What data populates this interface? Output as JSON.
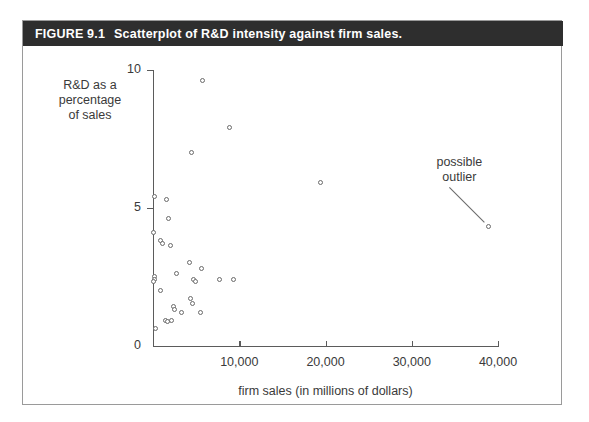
{
  "figure": {
    "number": "FIGURE 9.1",
    "caption": "Scatterplot of R&D intensity against firm sales."
  },
  "annotation": {
    "label": "possible\noutlier"
  },
  "chart_data": {
    "type": "scatter",
    "title": "Scatterplot of R&D intensity against firm sales.",
    "xlabel": "firm sales (in millions of dollars)",
    "ylabel": "R&D as a\npercentage\nof sales",
    "xlim": [
      0,
      40000
    ],
    "ylim": [
      0,
      10
    ],
    "xticks": [
      0,
      10000,
      20000,
      30000,
      40000
    ],
    "xticklabels": [
      "",
      "10,000",
      "20,000",
      "30,000",
      "40,000"
    ],
    "yticks": [
      0,
      5,
      10
    ],
    "yticklabels": [
      "0",
      "5",
      "10"
    ],
    "grid": false,
    "legend": null,
    "annotations": [
      {
        "text": "possible outlier",
        "points_to_x": 39000,
        "points_to_y": 4.3
      }
    ],
    "points": [
      {
        "x": 5800,
        "y": 9.6
      },
      {
        "x": 9000,
        "y": 7.9
      },
      {
        "x": 4600,
        "y": 7.0
      },
      {
        "x": 19500,
        "y": 5.9
      },
      {
        "x": 300,
        "y": 5.4
      },
      {
        "x": 1600,
        "y": 5.3
      },
      {
        "x": 1900,
        "y": 4.6
      },
      {
        "x": 150,
        "y": 4.1
      },
      {
        "x": 1000,
        "y": 3.8
      },
      {
        "x": 1200,
        "y": 3.7
      },
      {
        "x": 2100,
        "y": 3.6
      },
      {
        "x": 4300,
        "y": 3.0
      },
      {
        "x": 5700,
        "y": 2.8
      },
      {
        "x": 2800,
        "y": 2.6
      },
      {
        "x": 200,
        "y": 2.5
      },
      {
        "x": 250,
        "y": 2.4
      },
      {
        "x": 180,
        "y": 2.3
      },
      {
        "x": 4800,
        "y": 2.4
      },
      {
        "x": 5000,
        "y": 2.3
      },
      {
        "x": 7800,
        "y": 2.4
      },
      {
        "x": 9400,
        "y": 2.4
      },
      {
        "x": 900,
        "y": 2.0
      },
      {
        "x": 4400,
        "y": 1.7
      },
      {
        "x": 2400,
        "y": 1.4
      },
      {
        "x": 2600,
        "y": 1.3
      },
      {
        "x": 4700,
        "y": 1.5
      },
      {
        "x": 3400,
        "y": 1.2
      },
      {
        "x": 5600,
        "y": 1.2
      },
      {
        "x": 1500,
        "y": 0.9
      },
      {
        "x": 1800,
        "y": 0.85
      },
      {
        "x": 2200,
        "y": 0.9
      },
      {
        "x": 350,
        "y": 0.6
      },
      {
        "x": 39000,
        "y": 4.3
      }
    ]
  }
}
